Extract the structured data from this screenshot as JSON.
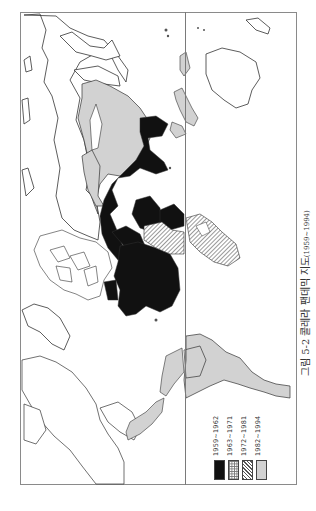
{
  "figure": {
    "caption_main": "그림 5-2 콜레라 팬데믹 지도",
    "caption_years": "(1959~1994)",
    "orientation": "rotated 90° clockwise"
  },
  "legend": {
    "items": [
      {
        "label": "1959~1962",
        "pattern": "solid-black",
        "color": "#111111"
      },
      {
        "label": "1963~1971",
        "pattern": "cross-hatch",
        "color": "#9a9a9a"
      },
      {
        "label": "1972~1981",
        "pattern": "diagonal-hatch",
        "color": "#777777"
      },
      {
        "label": "1982~1994",
        "pattern": "light-gray",
        "color": "#d2d2d2"
      }
    ]
  },
  "map": {
    "type": "world choropleth",
    "regions": [
      {
        "name": "South/Southeast Asia & Indonesia",
        "period": "1959~1962"
      },
      {
        "name": "Middle East / Central Asia",
        "period": "1959~1962"
      },
      {
        "name": "Africa (central & east)",
        "period": "1959~1962"
      },
      {
        "name": "West Africa",
        "period": "1972~1981"
      },
      {
        "name": "Russia / North Asia",
        "period": "1982~1994"
      },
      {
        "name": "Latin America",
        "period": "1982~1994"
      },
      {
        "name": "Central America",
        "period": "1982~1994"
      }
    ]
  }
}
